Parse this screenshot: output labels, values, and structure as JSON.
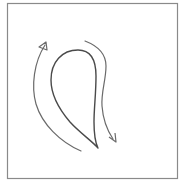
{
  "figure": {
    "stroke_color": "#555555",
    "border_color": "#8a8a8a",
    "background": "#ffffff",
    "elements": [
      {
        "name": "teardrop-loop",
        "kind": "closed-curve"
      },
      {
        "name": "left-arrow",
        "kind": "curved-arrow",
        "direction": "up"
      },
      {
        "name": "right-arrow",
        "kind": "curved-arrow",
        "direction": "down"
      }
    ]
  }
}
